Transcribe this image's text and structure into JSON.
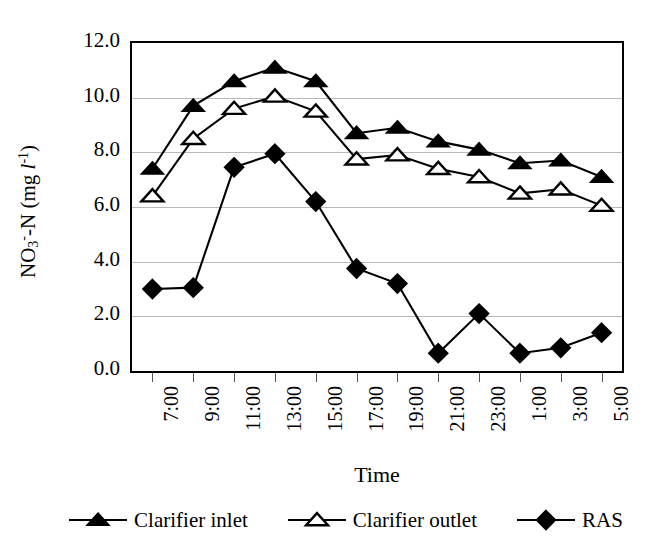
{
  "chart_data": {
    "type": "line",
    "title": "",
    "xlabel": "Time",
    "ylabel": "NO3--N (mg l-1)",
    "ylabel_parts": {
      "prefix": "NO",
      "sub": "3",
      "sup": "-",
      "mid": "-N (mg ",
      "italic": "l",
      "exp": "-1",
      "suffix": ")"
    },
    "categories": [
      "7:00",
      "9:00",
      "11:00",
      "13:00",
      "15:00",
      "17:00",
      "19:00",
      "21:00",
      "23:00",
      "1:00",
      "3:00",
      "5:00"
    ],
    "ylim": [
      0.0,
      12.0
    ],
    "ytick_labels": [
      "0.0",
      "2.0",
      "4.0",
      "6.0",
      "8.0",
      "10.0",
      "12.0"
    ],
    "ytick_values": [
      0.0,
      2.0,
      4.0,
      6.0,
      8.0,
      10.0,
      12.0
    ],
    "grid": "horizontal",
    "legend_position": "bottom",
    "series": [
      {
        "name": "Clarifier inlet",
        "marker": "filled-triangle",
        "color": "#000000",
        "values": [
          7.4,
          9.7,
          10.6,
          11.1,
          10.6,
          8.7,
          8.9,
          8.4,
          8.1,
          7.6,
          7.7,
          7.1
        ]
      },
      {
        "name": "Clarifier outlet",
        "marker": "open-triangle",
        "color": "#000000",
        "values": [
          6.4,
          8.5,
          9.6,
          10.05,
          9.5,
          7.75,
          7.9,
          7.4,
          7.1,
          6.5,
          6.65,
          6.05
        ]
      },
      {
        "name": "RAS",
        "marker": "filled-diamond",
        "color": "#000000",
        "values": [
          3.0,
          3.05,
          7.45,
          7.95,
          6.2,
          3.75,
          3.2,
          0.65,
          2.1,
          0.65,
          0.85,
          1.4
        ]
      }
    ]
  }
}
